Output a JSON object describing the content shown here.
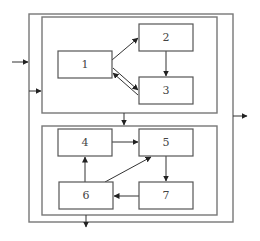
{
  "diagram": {
    "outer_frame": {
      "x": 29,
      "y": 14,
      "w": 204,
      "h": 208
    },
    "top_subsystem": {
      "x": 42,
      "y": 17,
      "w": 175,
      "h": 96
    },
    "bottom_subsystem": {
      "x": 42,
      "y": 126,
      "w": 175,
      "h": 89
    },
    "nodes": [
      {
        "id": "1",
        "label": "1",
        "x": 58,
        "y": 51,
        "w": 54,
        "h": 27
      },
      {
        "id": "2",
        "label": "2",
        "x": 139,
        "y": 24,
        "w": 54,
        "h": 27
      },
      {
        "id": "3",
        "label": "3",
        "x": 139,
        "y": 77,
        "w": 54,
        "h": 27
      },
      {
        "id": "4",
        "label": "4",
        "x": 58,
        "y": 129,
        "w": 54,
        "h": 27
      },
      {
        "id": "5",
        "label": "5",
        "x": 139,
        "y": 129,
        "w": 54,
        "h": 27
      },
      {
        "id": "6",
        "label": "6",
        "x": 59,
        "y": 182,
        "w": 54,
        "h": 27
      },
      {
        "id": "7",
        "label": "7",
        "x": 139,
        "y": 182,
        "w": 54,
        "h": 27
      }
    ],
    "edges": [
      {
        "from": "1",
        "to": "2"
      },
      {
        "from": "1",
        "to": "3"
      },
      {
        "from": "3",
        "to": "1"
      },
      {
        "from": "2",
        "to": "3"
      },
      {
        "from": "4",
        "to": "5"
      },
      {
        "from": "5",
        "to": "7"
      },
      {
        "from": "7",
        "to": "6"
      },
      {
        "from": "6",
        "to": "4"
      },
      {
        "from": "6",
        "to": "5"
      },
      {
        "from": "top_subsystem",
        "to": "bottom_subsystem"
      },
      {
        "from": "external_input",
        "to": "outer_frame"
      },
      {
        "from": "external_input",
        "to": "top_subsystem"
      },
      {
        "from": "outer_frame",
        "to": "external_output_right"
      },
      {
        "from": "bottom_subsystem",
        "to": "external_output_bottom"
      }
    ]
  }
}
